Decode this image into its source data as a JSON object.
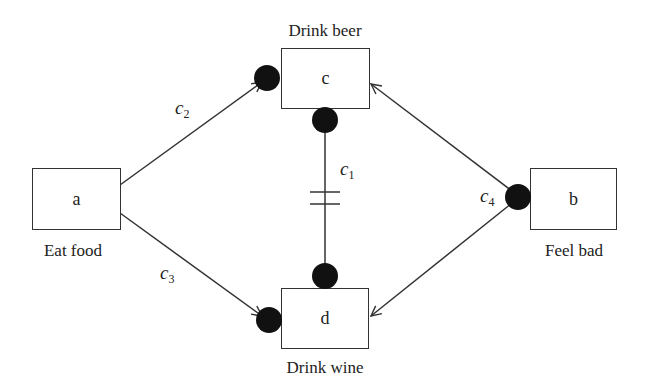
{
  "diagram": {
    "nodes": [
      {
        "id": "a",
        "label": "a",
        "caption": "Eat food"
      },
      {
        "id": "b",
        "label": "b",
        "caption": "Feel bad"
      },
      {
        "id": "c",
        "label": "c",
        "caption": "Drink beer"
      },
      {
        "id": "d",
        "label": "d",
        "caption": "Drink wine"
      }
    ],
    "edges": [
      {
        "id": "c1",
        "symbol": "c",
        "index": "1",
        "from": "c",
        "to": "d",
        "type": "mutual-inhibition (double bar)"
      },
      {
        "id": "c2",
        "symbol": "c",
        "index": "2",
        "from": "a",
        "to": "c",
        "type": "arrow with contact dot"
      },
      {
        "id": "c3",
        "symbol": "c",
        "index": "3",
        "from": "a",
        "to": "d",
        "type": "arrow with contact dot"
      },
      {
        "id": "c4",
        "symbol": "c",
        "index": "4",
        "from": "b",
        "to": [
          "c",
          "d"
        ],
        "type": "arrows from dot"
      }
    ],
    "colors": {
      "stroke": "#333333",
      "dot": "#111111",
      "background": "#ffffff"
    }
  }
}
